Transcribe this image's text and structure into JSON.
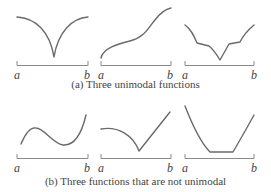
{
  "colors": {
    "curve": "#6a6a6a",
    "axis": "#8a8a8a",
    "text": "#444444"
  },
  "rows": [
    {
      "caption": "(a) Three unimodal functions",
      "panels": [
        {
          "name": "v-shaped-cusp",
          "a_label": "a",
          "b_label": "b"
        },
        {
          "name": "monotone-increasing",
          "a_label": "a",
          "b_label": "b"
        },
        {
          "name": "piecewise-v-with-bumps",
          "a_label": "a",
          "b_label": "b"
        }
      ]
    },
    {
      "caption": "(b) Three functions that are not unimodal",
      "panels": [
        {
          "name": "wave-with-local-max",
          "a_label": "a",
          "b_label": "b"
        },
        {
          "name": "curve-with-kink",
          "a_label": "a",
          "b_label": "b"
        },
        {
          "name": "flat-bottom-bowl",
          "a_label": "a",
          "b_label": "b"
        }
      ]
    }
  ]
}
